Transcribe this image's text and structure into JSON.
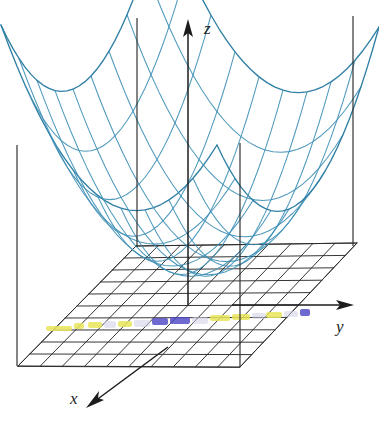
{
  "figure": {
    "background_color": "#ffffff"
  },
  "axes": [
    {
      "key": "x",
      "label": "x",
      "label_x": 70,
      "label_y": 404,
      "direction": "down-left",
      "tip_x": 89,
      "tip_y": 406,
      "tail_x": 168,
      "tail_y": 347
    },
    {
      "key": "y",
      "label": "y",
      "label_x": 336,
      "label_y": 332,
      "direction": "right",
      "tip_x": 352,
      "tip_y": 305,
      "tail_x": 232,
      "tail_y": 305
    },
    {
      "key": "z",
      "label": "z",
      "label_x": 204,
      "label_y": 34,
      "direction": "up",
      "tip_x": 188,
      "tip_y": 21,
      "tail_x": 188,
      "tail_y": 305
    }
  ],
  "surface": {
    "type": "elliptic-paraboloid",
    "equation": "z = x^2 + y^2",
    "mesh_color": "#3f90b6",
    "rim_color": "#2f7fa4",
    "mesh_rows": 9,
    "mesh_cols": 9,
    "corners": [
      {
        "name": "back",
        "x": 137,
        "y": 18
      },
      {
        "name": "right",
        "x": 353,
        "y": 16
      },
      {
        "name": "front-right",
        "x": 240,
        "y": 143
      },
      {
        "name": "left",
        "x": 17,
        "y": 145
      }
    ],
    "vertex": {
      "x": 190,
      "y": 262
    }
  },
  "plane": {
    "name": "xy-plane",
    "grid_color": "#2b2b2b",
    "fill_color": "#ffffff",
    "divisions_u": 10,
    "divisions_v": 10,
    "corners": [
      {
        "name": "left",
        "x": 18,
        "y": 366
      },
      {
        "name": "back",
        "x": 136,
        "y": 246
      },
      {
        "name": "right",
        "x": 357,
        "y": 243
      },
      {
        "name": "front",
        "x": 240,
        "y": 367
      }
    ]
  },
  "drop_lines": [
    {
      "name": "back-corner",
      "x1": 137,
      "y1": 18,
      "x2": 137,
      "y2": 247
    },
    {
      "name": "right-corner",
      "x1": 353,
      "y1": 16,
      "x2": 353,
      "y2": 246
    },
    {
      "name": "front-right-corner",
      "x1": 240,
      "y1": 143,
      "x2": 240,
      "y2": 367
    },
    {
      "name": "left-corner",
      "x1": 17,
      "y1": 145,
      "x2": 17,
      "y2": 366
    }
  ],
  "highlighter_marks": {
    "description": "Scanned highlighter strokes across the grid plane",
    "colors": {
      "yellow": "#e9e55a",
      "blue": "#4b44c4",
      "pale": "#cfcfe8"
    },
    "band_y": 322,
    "segments": [
      {
        "color": "yellow",
        "x": 46,
        "y": 326,
        "w": 26,
        "h": 5
      },
      {
        "color": "yellow",
        "x": 74,
        "y": 323,
        "w": 10,
        "h": 6
      },
      {
        "color": "yellow",
        "x": 88,
        "y": 322,
        "w": 14,
        "h": 6
      },
      {
        "color": "pale",
        "x": 104,
        "y": 321,
        "w": 12,
        "h": 7
      },
      {
        "color": "yellow",
        "x": 118,
        "y": 321,
        "w": 14,
        "h": 6
      },
      {
        "color": "pale",
        "x": 134,
        "y": 320,
        "w": 16,
        "h": 7
      },
      {
        "color": "blue",
        "x": 152,
        "y": 318,
        "w": 16,
        "h": 7
      },
      {
        "color": "blue",
        "x": 170,
        "y": 317,
        "w": 20,
        "h": 7
      },
      {
        "color": "pale",
        "x": 192,
        "y": 317,
        "w": 16,
        "h": 7
      },
      {
        "color": "yellow",
        "x": 210,
        "y": 315,
        "w": 20,
        "h": 6
      },
      {
        "color": "yellow",
        "x": 232,
        "y": 314,
        "w": 18,
        "h": 6
      },
      {
        "color": "pale",
        "x": 252,
        "y": 313,
        "w": 14,
        "h": 6
      },
      {
        "color": "yellow",
        "x": 266,
        "y": 312,
        "w": 16,
        "h": 6
      },
      {
        "color": "pale",
        "x": 284,
        "y": 311,
        "w": 14,
        "h": 6
      },
      {
        "color": "blue",
        "x": 300,
        "y": 309,
        "w": 10,
        "h": 7
      }
    ]
  }
}
